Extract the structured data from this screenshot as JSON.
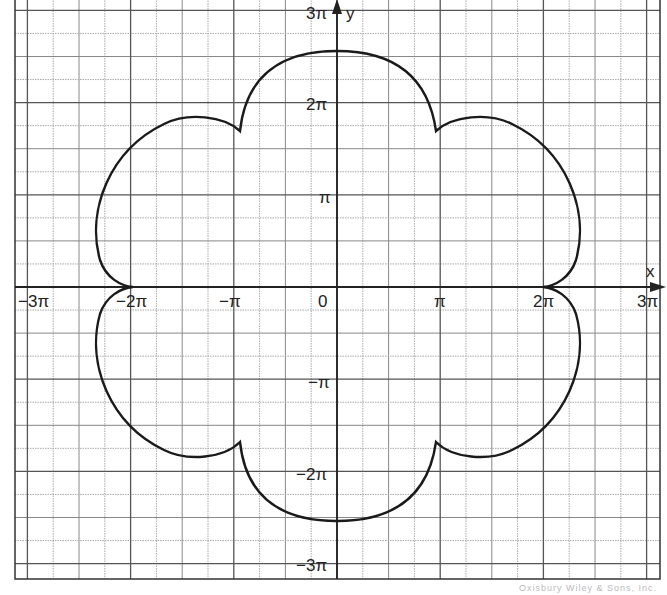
{
  "chart_data": {
    "type": "line",
    "title": "",
    "xlabel": "x",
    "ylabel": "y",
    "xlim": [
      "-3π",
      "3π"
    ],
    "ylim": [
      "-3π",
      "3π"
    ],
    "grid": true,
    "grid_minor_step": "π/4",
    "x_ticks": [
      "-3π",
      "-2π",
      "-π",
      "0",
      "π",
      "2π",
      "3π"
    ],
    "y_ticks": [
      "3π",
      "2π",
      "π",
      "-π",
      "-2π",
      "-3π"
    ],
    "series": [
      {
        "name": "closed curve (six-lobed flower)",
        "points_in_pi_units": [
          {
            "x": 0,
            "y": 2.57
          },
          {
            "x": 0.6,
            "y": 2.45
          },
          {
            "x": 0.98,
            "y": 1.95
          },
          {
            "x": 1.0,
            "y": 1.7
          },
          {
            "x": 1.4,
            "y": 1.8
          },
          {
            "x": 2.0,
            "y": 1.45
          },
          {
            "x": 2.32,
            "y": 0.75
          },
          {
            "x": 2.2,
            "y": 0.2
          },
          {
            "x": 2.0,
            "y": 0
          },
          {
            "x": 2.2,
            "y": -0.2
          },
          {
            "x": 2.32,
            "y": -0.75
          },
          {
            "x": 2.0,
            "y": -1.45
          },
          {
            "x": 1.4,
            "y": -1.8
          },
          {
            "x": 1.0,
            "y": -1.7
          },
          {
            "x": 0.98,
            "y": -1.95
          },
          {
            "x": 0.6,
            "y": -2.45
          },
          {
            "x": 0,
            "y": -2.55
          },
          {
            "x": -0.6,
            "y": -2.45
          },
          {
            "x": -0.98,
            "y": -1.95
          },
          {
            "x": -1.0,
            "y": -1.7
          },
          {
            "x": -1.4,
            "y": -1.8
          },
          {
            "x": -2.0,
            "y": -1.45
          },
          {
            "x": -2.32,
            "y": -0.75
          },
          {
            "x": -2.2,
            "y": -0.2
          },
          {
            "x": -2.0,
            "y": 0
          },
          {
            "x": -2.2,
            "y": 0.2
          },
          {
            "x": -2.32,
            "y": 0.75
          },
          {
            "x": -2.0,
            "y": 1.45
          },
          {
            "x": -1.4,
            "y": 1.8
          },
          {
            "x": -1.0,
            "y": 1.7
          },
          {
            "x": -0.98,
            "y": 1.95
          },
          {
            "x": -0.6,
            "y": 2.45
          },
          {
            "x": 0,
            "y": 2.57
          }
        ],
        "cusps_in_pi_units": [
          {
            "x": 1,
            "y": 1.7
          },
          {
            "x": 2,
            "y": 0
          },
          {
            "x": 1,
            "y": -1.7
          },
          {
            "x": -1,
            "y": -1.7
          },
          {
            "x": -2,
            "y": 0
          },
          {
            "x": -1,
            "y": 1.7
          }
        ]
      }
    ]
  },
  "axes": {
    "x_label": "x",
    "y_label": "y",
    "x_tick_labels": [
      "−3π",
      "−2π",
      "−π",
      "0",
      "π",
      "2π",
      "3π"
    ],
    "y_tick_labels": [
      "3π",
      "2π",
      "π",
      "−π",
      "−2π",
      "−3π"
    ]
  },
  "watermark": "Oxisbury Wiley & Sons, Inc."
}
